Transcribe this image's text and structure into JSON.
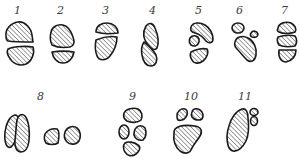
{
  "diagram": {
    "type": "figure-panel",
    "colors": {
      "outline": "#1a1a1a",
      "hatch": "#2a2a2a",
      "background": "#ffffff",
      "label": "#3a3a3a"
    },
    "figures": [
      {
        "id": 1,
        "label": "1",
        "label_pos": [
          17,
          14
        ],
        "shape_count": 2
      },
      {
        "id": 2,
        "label": "2",
        "label_pos": [
          60,
          14
        ],
        "shape_count": 2
      },
      {
        "id": 3,
        "label": "3",
        "label_pos": [
          105,
          14
        ],
        "shape_count": 2
      },
      {
        "id": 4,
        "label": "4",
        "label_pos": [
          152,
          14
        ],
        "shape_count": 2
      },
      {
        "id": 5,
        "label": "5",
        "label_pos": [
          198,
          14
        ],
        "shape_count": 3
      },
      {
        "id": 6,
        "label": "6",
        "label_pos": [
          239,
          14
        ],
        "shape_count": 3
      },
      {
        "id": 7,
        "label": "7",
        "label_pos": [
          284,
          14
        ],
        "shape_count": 3
      },
      {
        "id": 8,
        "label": "8",
        "label_pos": [
          39,
          100
        ],
        "shape_count": 4
      },
      {
        "id": 9,
        "label": "9",
        "label_pos": [
          131,
          100
        ],
        "shape_count": 4
      },
      {
        "id": 10,
        "label": "10",
        "label_pos": [
          186,
          100
        ],
        "shape_count": 3
      },
      {
        "id": 11,
        "label": "11",
        "label_pos": [
          240,
          100
        ],
        "shape_count": 3
      }
    ]
  }
}
